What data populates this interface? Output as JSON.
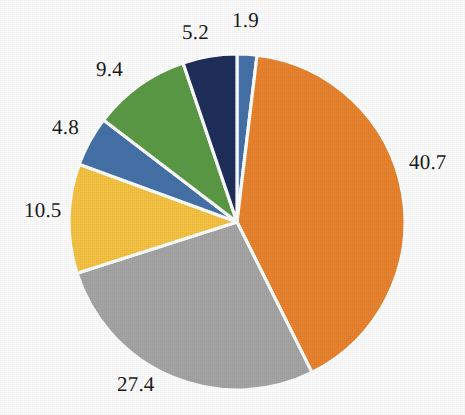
{
  "chart_data": {
    "type": "pie",
    "title": "",
    "subtitle": "",
    "xlabel": "",
    "ylabel": "",
    "legend_position": "none",
    "grid": false,
    "start_angle_deg": 0,
    "direction": "clockwise",
    "labels_shown": "values",
    "total": 99.9,
    "categories": [
      "Slice 1",
      "Slice 2",
      "Slice 3",
      "Slice 4",
      "Slice 5",
      "Slice 6",
      "Slice 7"
    ],
    "values": [
      1.9,
      40.7,
      27.4,
      10.5,
      4.8,
      9.4,
      5.2
    ],
    "value_labels": [
      "1.9",
      "40.7",
      "27.4",
      "10.5",
      "4.8",
      "9.4",
      "5.2"
    ],
    "colors": [
      "#4472A8",
      "#E8832E",
      "#A5A5A5",
      "#F5C242",
      "#4472A8",
      "#5A9A46",
      "#1F2F5B"
    ],
    "slices": [
      {
        "label": "1.9",
        "value": 1.9,
        "color": "#4472A8",
        "label_x": 232,
        "label_y": 10,
        "anchor": "start"
      },
      {
        "label": "40.7",
        "value": 40.7,
        "color": "#E8832E",
        "label_x": 409,
        "label_y": 152,
        "anchor": "start"
      },
      {
        "label": "27.4",
        "value": 27.4,
        "color": "#A5A5A5",
        "label_x": 117,
        "label_y": 374,
        "anchor": "start"
      },
      {
        "label": "10.5",
        "value": 10.5,
        "color": "#F5C242",
        "label_x": 24,
        "label_y": 200,
        "anchor": "start"
      },
      {
        "label": "4.8",
        "value": 4.8,
        "color": "#4472A8",
        "label_x": 52,
        "label_y": 117,
        "anchor": "start"
      },
      {
        "label": "9.4",
        "value": 9.4,
        "color": "#5A9A46",
        "label_x": 96,
        "label_y": 59,
        "anchor": "start"
      },
      {
        "label": "5.2",
        "value": 5.2,
        "color": "#1F2F5B",
        "label_x": 182,
        "label_y": 22,
        "anchor": "start"
      }
    ],
    "geometry": {
      "center_x": 237,
      "center_y": 222,
      "radius": 168,
      "separator_color": "#FFFFFF",
      "separator_width": 3.2
    },
    "background_color": "#FEFEFE",
    "label_text_color": "#1A1A1A"
  }
}
